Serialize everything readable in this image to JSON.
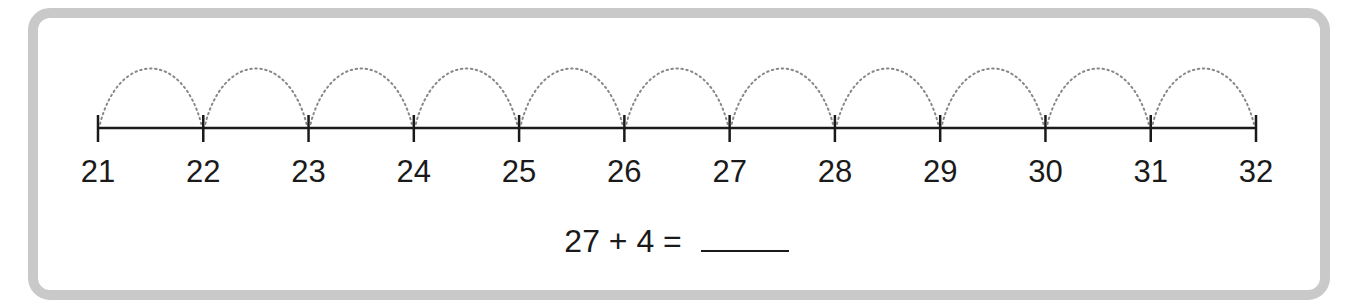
{
  "number_line": {
    "start": 21,
    "end": 32,
    "labels": [
      "21",
      "22",
      "23",
      "24",
      "25",
      "26",
      "27",
      "28",
      "29",
      "30",
      "31",
      "32"
    ],
    "hops": 11,
    "hop_style": "dotted-arc"
  },
  "equation": {
    "left_operand": "27",
    "operator": "+",
    "right_operand": "4",
    "equals": "=",
    "answer": ""
  },
  "colors": {
    "frame_border": "#c9c9c9",
    "line": "#1a1a1a",
    "arc": "#888888",
    "text": "#1a1a1a"
  }
}
